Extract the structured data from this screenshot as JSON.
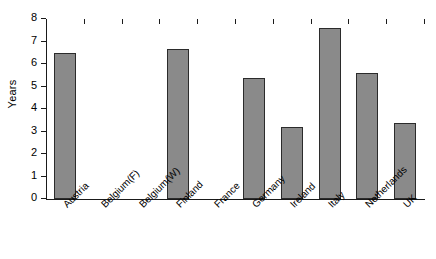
{
  "chart_data": {
    "type": "bar",
    "title": "",
    "subtitle": "",
    "xlabel": "",
    "ylabel": "Years",
    "ylim": [
      0,
      8
    ],
    "yticks": [
      0,
      1,
      2,
      3,
      4,
      5,
      6,
      7,
      8
    ],
    "ytick_labels": [
      "0",
      "1",
      "2",
      "3",
      "4",
      "5",
      "6",
      "7",
      "8"
    ],
    "grid": false,
    "legend": false,
    "legend_position": "none",
    "bar_color": "#8a8a8a",
    "bar_edge_color": "#2b2b2b",
    "axis_color": "#1a1a1a",
    "categories": [
      "Austria",
      "Belgium(F)",
      "Belgium(W)",
      "Finland",
      "France",
      "Germany",
      "Ireland",
      "Italy",
      "Netherlands",
      "UK"
    ],
    "values": [
      6.5,
      0,
      0,
      6.65,
      0,
      5.4,
      3.2,
      7.6,
      5.6,
      3.4
    ],
    "series": [
      {
        "name": "Years",
        "values": [
          6.5,
          0,
          0,
          6.65,
          0,
          5.4,
          3.2,
          7.6,
          5.6,
          3.4
        ]
      }
    ]
  }
}
